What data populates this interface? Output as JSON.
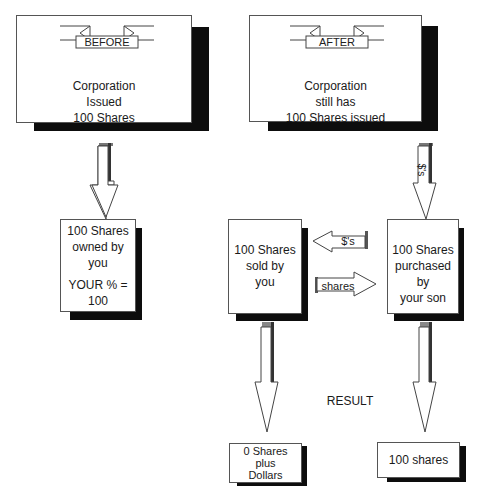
{
  "before_panel": {
    "banner": "BEFORE",
    "lines": [
      "Corporation",
      "Issued",
      "100 Shares"
    ]
  },
  "after_panel": {
    "banner": "AFTER",
    "lines": [
      "Corporation",
      "still has",
      "100 Shares issued"
    ]
  },
  "owned_box": {
    "line1": "100 Shares",
    "line2": "owned by you",
    "line3": "YOUR % =",
    "line4": "100"
  },
  "sold_box": {
    "lines": [
      "100 Shares",
      "sold by",
      "you"
    ]
  },
  "purchased_box": {
    "lines": [
      "100 Shares",
      "purchased by",
      "your son"
    ]
  },
  "arrows": {
    "after_down_label": "$'s",
    "dollars_left_label": "$'s",
    "shares_right_label": "shares"
  },
  "result_label": "RESULT",
  "result_left_box": {
    "lines": [
      "0 Shares",
      "plus",
      "Dollars"
    ]
  },
  "result_right_box": {
    "line1": "100 shares"
  }
}
